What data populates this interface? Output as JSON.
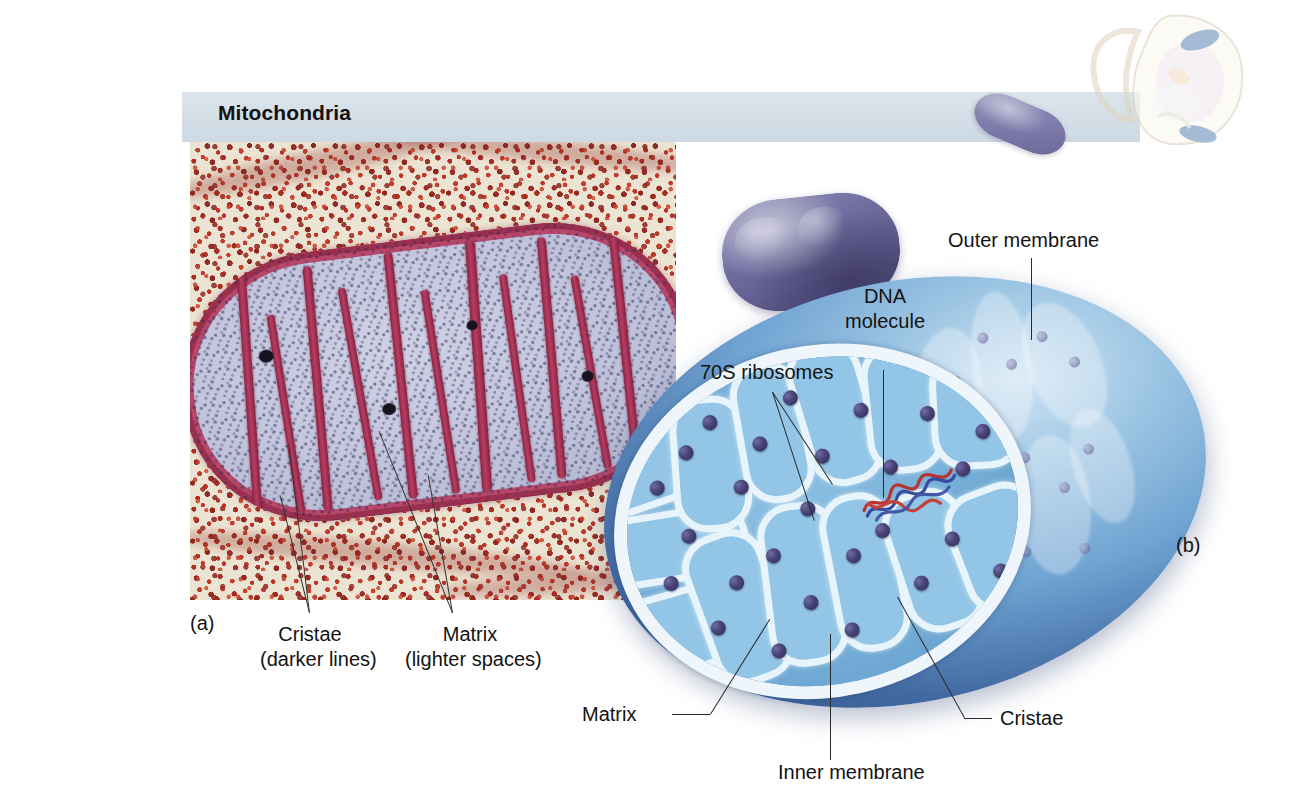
{
  "figure": {
    "banner_title": "Mitochondria",
    "panel_a_letter": "(a)",
    "panel_b_letter": "(b)"
  },
  "micrograph_labels": {
    "cristae_line1": "Cristae",
    "cristae_line2": "(darker lines)",
    "matrix_line1": "Matrix",
    "matrix_line2": "(lighter spaces)"
  },
  "illustration_labels": {
    "ribosomes": "70S ribosomes",
    "dna_line1": "DNA",
    "dna_line2": "molecule",
    "outer_membrane": "Outer membrane",
    "matrix": "Matrix",
    "inner_membrane": "Inner membrane",
    "cristae": "Cristae"
  },
  "colors": {
    "banner_background": "#d3dee7",
    "text": "#131313",
    "micrograph_cytoplasm": "#ece4d2",
    "micrograph_cristae": "#a5325a",
    "micrograph_matrix": "#c3c6dd",
    "mito_purple": "#6f6d9f",
    "mito_outer_blue": "#2c4a85",
    "mito_matrix_blue": "#77b0d8",
    "cristae_white": "#e8f4fb",
    "ribosome_navy": "#474376",
    "dna_red": "#b8342e",
    "dna_blue": "#3a4a9c"
  }
}
